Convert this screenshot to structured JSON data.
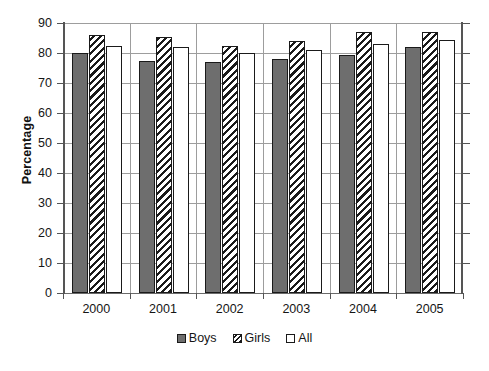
{
  "chart_data": {
    "type": "bar",
    "title": "",
    "subtitle": "",
    "xlabel": "",
    "ylabel": "Percentage",
    "categories": [
      "2000",
      "2001",
      "2002",
      "2003",
      "2004",
      "2005"
    ],
    "series": [
      {
        "name": "Boys",
        "values": [
          80.0,
          77.5,
          77.0,
          78.0,
          79.5,
          82.0
        ]
      },
      {
        "name": "Girls",
        "values": [
          86.0,
          85.5,
          82.5,
          84.0,
          87.0,
          87.0
        ]
      },
      {
        "name": "All",
        "values": [
          82.5,
          82.0,
          80.0,
          81.0,
          83.0,
          84.5
        ]
      }
    ],
    "ylim": [
      0,
      90
    ],
    "ytick_labels": [
      "90",
      "80",
      "70",
      "60",
      "50",
      "40",
      "30",
      "20",
      "10",
      "0"
    ],
    "ytick_values": [
      90,
      80,
      70,
      60,
      50,
      40,
      30,
      20,
      10,
      0
    ],
    "ytick_interval": 10,
    "grid": "horizontal-and-category-separators",
    "legend_position": "bottom-center",
    "legend": [
      {
        "label": "Boys",
        "swatch": "solid-gray",
        "color": "#6e6e6e"
      },
      {
        "label": "Girls",
        "swatch": "diagonal-hatch",
        "color": "#ffffff"
      },
      {
        "label": "All",
        "swatch": "empty-white",
        "color": "#ffffff"
      }
    ]
  },
  "axis": {
    "y_title": "Percentage"
  },
  "colors": {
    "boys_fill": "#6e6e6e",
    "girls_fill": "#ffffff",
    "all_fill": "#ffffff",
    "bar_border": "#1a1a1a",
    "gridline": "#9d9d9d",
    "axis_spine": "#555555",
    "text": "#151515",
    "background": "#ffffff"
  }
}
